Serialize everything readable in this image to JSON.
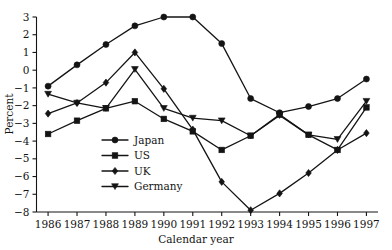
{
  "chart_data": {
    "type": "line",
    "title": "",
    "xlabel": "Calendar year",
    "ylabel": "Percent",
    "x": [
      1986,
      1987,
      1988,
      1989,
      1990,
      1991,
      1992,
      1993,
      1994,
      1995,
      1996,
      1997
    ],
    "categories": [
      "1986",
      "1987",
      "1988",
      "1989",
      "1990",
      "1991",
      "1992",
      "1993",
      "1994",
      "1995",
      "1996",
      "1997"
    ],
    "xlim": [
      1985.6,
      1997.4
    ],
    "ylim": [
      -8,
      3
    ],
    "yticks": [
      3,
      2,
      1,
      0,
      -1,
      -2,
      -3,
      -4,
      -5,
      -6,
      -7,
      -8
    ],
    "ytick_labels": [
      "3",
      "2",
      "1",
      "0",
      "−1",
      "−2",
      "−3",
      "−4",
      "−5",
      "−6",
      "−7",
      "−8"
    ],
    "grid": false,
    "legend_position": "center-left",
    "series": [
      {
        "name": "Japan",
        "marker": "circle",
        "values": [
          -0.9,
          0.3,
          1.45,
          2.5,
          3.0,
          3.0,
          1.5,
          -1.6,
          -2.4,
          -2.05,
          -1.6,
          -0.5
        ]
      },
      {
        "name": "US",
        "marker": "square",
        "values": [
          -3.6,
          -2.85,
          -2.15,
          -1.75,
          -2.75,
          -3.45,
          -4.5,
          -3.7,
          -2.5,
          -3.65,
          -4.5,
          -2.1
        ]
      },
      {
        "name": "UK",
        "marker": "diamond",
        "values": [
          -2.45,
          -1.85,
          -0.7,
          1.0,
          -1.05,
          -3.35,
          -6.3,
          -7.9,
          -6.95,
          -5.8,
          -4.5,
          -3.55
        ]
      },
      {
        "name": "Germany",
        "marker": "triangle-down",
        "values": [
          -1.35,
          -1.85,
          -2.15,
          0.05,
          -2.15,
          -2.7,
          -2.85,
          -3.7,
          -2.55,
          -3.65,
          -3.9,
          -1.75
        ]
      }
    ]
  },
  "legend": {
    "entries": [
      {
        "label": "Japan",
        "marker": "circle"
      },
      {
        "label": "US",
        "marker": "square"
      },
      {
        "label": "UK",
        "marker": "diamond"
      },
      {
        "label": "Germany",
        "marker": "triangle-down"
      }
    ]
  },
  "colors": {
    "ink": "#141414",
    "background": "#ffffff"
  }
}
